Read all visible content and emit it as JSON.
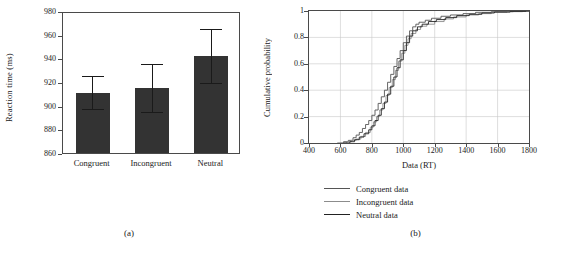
{
  "figure": {
    "panel_a_caption": "(a)",
    "panel_b_caption": "(b)"
  },
  "chart_data": [
    {
      "type": "bar",
      "panel": "(a)",
      "title": "",
      "xlabel": "",
      "ylabel": "Reaction time (ms)",
      "categories": [
        "Congruent",
        "Incongruent",
        "Neutral"
      ],
      "values": [
        911,
        915,
        942
      ],
      "errors": [
        14,
        20,
        23
      ],
      "error_type": "symmetric error bars",
      "ylim": [
        860,
        980
      ],
      "yticks": [
        860,
        880,
        900,
        920,
        940,
        960,
        980
      ],
      "grid": false,
      "bar_color": "#333333"
    },
    {
      "type": "line",
      "panel": "(b)",
      "title": "",
      "xlabel": "Data (RT)",
      "ylabel": "Cumulative probability",
      "xlim": [
        400,
        1800
      ],
      "ylim": [
        0,
        1
      ],
      "xticks": [
        400,
        600,
        800,
        1000,
        1200,
        1400,
        1600,
        1800
      ],
      "yticks": [
        0,
        0.2,
        0.4,
        0.6,
        0.8,
        1
      ],
      "grid": true,
      "legend_position": "below",
      "series": [
        {
          "name": "Congruent data",
          "color": "#555555",
          "x": [
            580,
            620,
            650,
            680,
            700,
            720,
            740,
            760,
            780,
            800,
            820,
            840,
            860,
            880,
            900,
            920,
            940,
            960,
            980,
            1000,
            1020,
            1040,
            1060,
            1080,
            1100,
            1140,
            1180,
            1240,
            1300,
            1380,
            1460,
            1560,
            1700,
            1800
          ],
          "y": [
            0.0,
            0.01,
            0.02,
            0.04,
            0.06,
            0.08,
            0.11,
            0.14,
            0.17,
            0.21,
            0.25,
            0.3,
            0.35,
            0.4,
            0.46,
            0.52,
            0.58,
            0.64,
            0.7,
            0.76,
            0.81,
            0.85,
            0.88,
            0.9,
            0.915,
            0.93,
            0.945,
            0.96,
            0.97,
            0.98,
            0.99,
            0.995,
            1.0,
            1.0
          ]
        },
        {
          "name": "Incongruent data",
          "color": "#8c8c8c",
          "x": [
            600,
            640,
            670,
            700,
            730,
            760,
            790,
            810,
            830,
            850,
            870,
            890,
            910,
            930,
            950,
            970,
            990,
            1010,
            1030,
            1050,
            1080,
            1110,
            1150,
            1200,
            1260,
            1320,
            1400,
            1480,
            1560,
            1660,
            1760,
            1800
          ],
          "y": [
            0.0,
            0.01,
            0.02,
            0.03,
            0.05,
            0.08,
            0.12,
            0.16,
            0.2,
            0.25,
            0.3,
            0.36,
            0.42,
            0.48,
            0.55,
            0.62,
            0.68,
            0.74,
            0.79,
            0.83,
            0.86,
            0.885,
            0.9,
            0.92,
            0.94,
            0.955,
            0.97,
            0.98,
            0.99,
            0.995,
            1.0,
            1.0
          ]
        },
        {
          "name": "Neutral data",
          "color": "#222222",
          "x": [
            620,
            660,
            690,
            720,
            750,
            780,
            800,
            820,
            840,
            860,
            880,
            900,
            920,
            940,
            960,
            980,
            1000,
            1020,
            1040,
            1060,
            1090,
            1120,
            1160,
            1210,
            1270,
            1340,
            1420,
            1500,
            1580,
            1680,
            1780,
            1800
          ],
          "y": [
            0.0,
            0.01,
            0.025,
            0.045,
            0.07,
            0.1,
            0.13,
            0.17,
            0.21,
            0.26,
            0.31,
            0.37,
            0.43,
            0.5,
            0.57,
            0.63,
            0.7,
            0.76,
            0.81,
            0.85,
            0.88,
            0.9,
            0.92,
            0.935,
            0.95,
            0.965,
            0.975,
            0.985,
            0.992,
            0.997,
            1.0,
            1.0
          ]
        }
      ]
    }
  ]
}
